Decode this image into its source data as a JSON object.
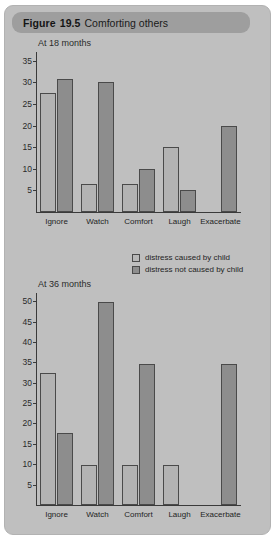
{
  "figure": {
    "label": "Figure",
    "number": "19.5",
    "caption": "Comforting others"
  },
  "legend": {
    "position": "middle-right",
    "entries": [
      {
        "label": "distress caused by child",
        "color": "#b8b8b8",
        "key": "caused"
      },
      {
        "label": "distress not caused by child",
        "color": "#8d8d8d",
        "key": "not_caused"
      }
    ]
  },
  "colors": {
    "card_background": "#bfbfbf",
    "title_bar": "#9e9e9e",
    "bar_light": "#b3b3b3",
    "bar_dark": "#8d8d8d",
    "bar_outline": "#4a4a4a",
    "axis": "#3a3a3a",
    "text": "#242424"
  },
  "chart_data": [
    {
      "type": "bar",
      "title": "At 18 months",
      "categories": [
        "Ignore",
        "Watch",
        "Comfort",
        "Laugh",
        "Exacerbate"
      ],
      "series": [
        {
          "name": "distress caused by child",
          "values": [
            27.5,
            6.5,
            6.5,
            15.0,
            0
          ]
        },
        {
          "name": "distress not caused by child",
          "values": [
            30.7,
            30.0,
            10.0,
            5.0,
            19.8
          ]
        }
      ],
      "xlabel": "",
      "ylabel": "",
      "ylim": [
        0,
        37
      ],
      "yticks": [
        5,
        10,
        15,
        20,
        25,
        30,
        35
      ],
      "grid": false,
      "legend": "right"
    },
    {
      "type": "bar",
      "title": "At 36 months",
      "categories": [
        "Ignore",
        "Watch",
        "Comfort",
        "Laugh",
        "Exacerbate"
      ],
      "series": [
        {
          "name": "distress caused by child",
          "values": [
            32.5,
            9.7,
            9.7,
            9.7,
            0
          ]
        },
        {
          "name": "distress not caused by child",
          "values": [
            17.7,
            49.8,
            34.6,
            0,
            34.6
          ]
        }
      ],
      "xlabel": "",
      "ylabel": "",
      "ylim": [
        0,
        52
      ],
      "yticks": [
        5,
        10,
        15,
        20,
        25,
        30,
        35,
        40,
        45,
        50
      ],
      "grid": false,
      "legend": "none"
    }
  ]
}
